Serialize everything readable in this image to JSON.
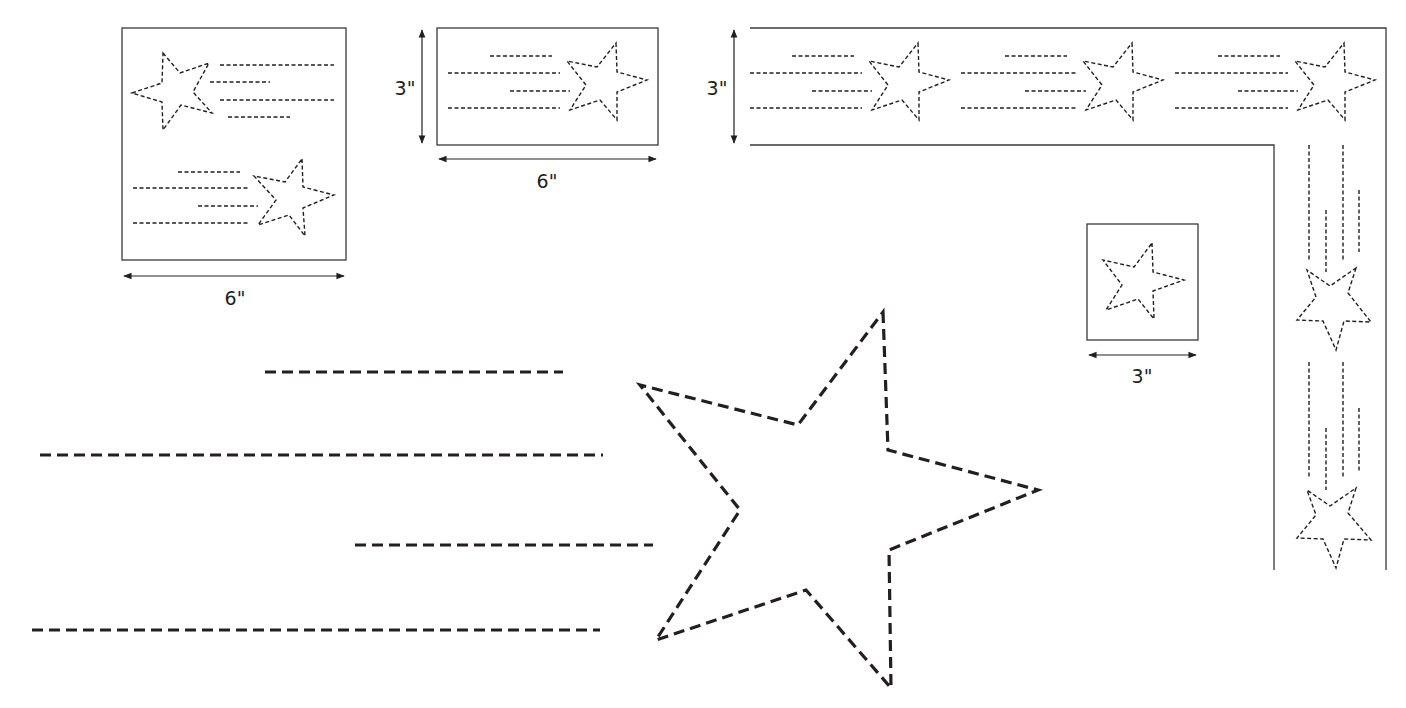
{
  "colors": {
    "ink": "#231f20",
    "frame": "#3a3a3a",
    "background": "#ffffff"
  },
  "dimension_labels": {
    "square_width": "6\"",
    "rect_width": "6\"",
    "rect_height": "3\"",
    "border_height": "3\"",
    "small_square_width": "3\""
  },
  "panels": [
    {
      "id": "square-6x6",
      "description": "6 inch square with two shooting stars",
      "width_label": "6\""
    },
    {
      "id": "rect-3x6",
      "description": "3 by 6 inch rectangle with one shooting star",
      "width_label": "6\"",
      "height_label": "3\""
    },
    {
      "id": "corner-border",
      "description": "3 inch corner border with repeating shooting stars",
      "height_label": "3\""
    },
    {
      "id": "square-3x3",
      "description": "3 inch square with single star",
      "width_label": "3\""
    },
    {
      "id": "full-size-pattern",
      "description": "Full-size shooting star pattern with four trailing lines"
    }
  ]
}
